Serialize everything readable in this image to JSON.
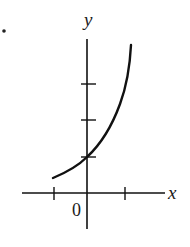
{
  "figure": {
    "type": "function-graph",
    "bullet": "•",
    "axes": {
      "x_label": "x",
      "y_label": "y",
      "origin_label": "0",
      "x_ticks": [
        -1,
        1
      ],
      "y_ticks": [
        1,
        2,
        3
      ]
    },
    "curve": {
      "kind": "exponential",
      "y_intercept_tick": 1,
      "color": "#111111"
    }
  }
}
